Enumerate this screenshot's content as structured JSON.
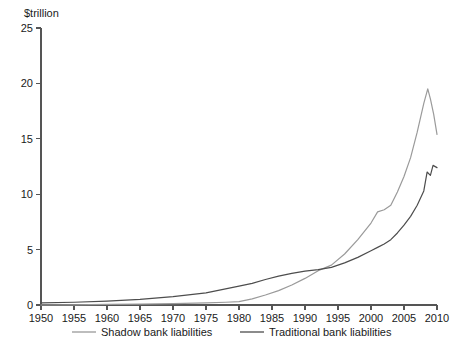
{
  "chart_data": {
    "type": "line",
    "title": "",
    "subtitle": "",
    "unit_label": "$trillion",
    "xlabel": "",
    "ylabel": "",
    "xlim": [
      1950,
      2010
    ],
    "ylim": [
      0,
      25
    ],
    "grid": false,
    "legend_position": "bottom",
    "x_ticks": [
      1950,
      1955,
      1960,
      1965,
      1970,
      1975,
      1980,
      1985,
      1990,
      1995,
      2000,
      2005,
      2010
    ],
    "x_tick_labels": [
      "1950",
      "1955",
      "1960",
      "1965",
      "1970",
      "1975",
      "1980",
      "1985",
      "1990",
      "1995",
      "2000",
      "2005",
      "2010"
    ],
    "y_ticks": [
      0,
      5,
      10,
      15,
      20,
      25
    ],
    "y_tick_labels": [
      "0",
      "5",
      "10",
      "15",
      "20",
      "25"
    ],
    "series": [
      {
        "name": "Shadow bank liabilities",
        "color": "#9a9a9a",
        "x": [
          1950,
          1955,
          1960,
          1965,
          1970,
          1975,
          1978,
          1980,
          1982,
          1984,
          1986,
          1988,
          1990,
          1992,
          1994,
          1996,
          1998,
          2000,
          2001,
          2002,
          2003,
          2004,
          2005,
          2006,
          2007,
          2008,
          2008.6,
          2009,
          2009.5,
          2010
        ],
        "values": [
          0.0,
          0.02,
          0.05,
          0.08,
          0.12,
          0.2,
          0.25,
          0.3,
          0.55,
          0.9,
          1.3,
          1.8,
          2.4,
          3.1,
          3.6,
          4.6,
          5.9,
          7.4,
          8.4,
          8.6,
          9.0,
          10.2,
          11.6,
          13.3,
          15.6,
          18.2,
          19.5,
          18.6,
          17.2,
          15.4
        ]
      },
      {
        "name": "Traditional bank liabilities",
        "color": "#4d4d4d",
        "x": [
          1950,
          1955,
          1960,
          1965,
          1970,
          1975,
          1980,
          1982,
          1984,
          1986,
          1988,
          1990,
          1992,
          1994,
          1996,
          1998,
          2000,
          2001,
          2002,
          2003,
          2004,
          2005,
          2006,
          2007,
          2008,
          2008.5,
          2009,
          2009.4,
          2010
        ],
        "values": [
          0.2,
          0.25,
          0.35,
          0.5,
          0.75,
          1.1,
          1.7,
          1.95,
          2.3,
          2.6,
          2.85,
          3.05,
          3.2,
          3.4,
          3.8,
          4.3,
          4.9,
          5.2,
          5.5,
          5.9,
          6.5,
          7.2,
          8.0,
          9.0,
          10.3,
          12.0,
          11.7,
          12.6,
          12.4
        ]
      }
    ],
    "annotations": []
  },
  "legend": {
    "items": [
      {
        "label": "Shadow bank liabilities",
        "color": "#9a9a9a"
      },
      {
        "label": "Traditional bank liabilities",
        "color": "#4d4d4d"
      }
    ]
  }
}
